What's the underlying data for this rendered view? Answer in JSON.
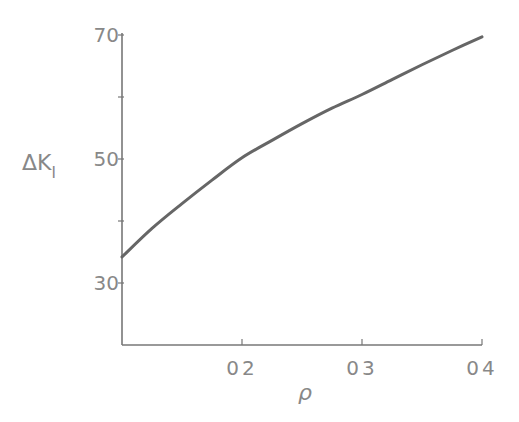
{
  "chart_data": {
    "type": "line",
    "title": "",
    "xlabel": "ρ",
    "ylabel_main": "ΔK",
    "ylabel_sub": "I",
    "xlim": [
      0.1,
      0.4
    ],
    "ylim": [
      20,
      70
    ],
    "x_ticks": [
      0.2,
      0.3,
      0.4
    ],
    "x_tick_labels": [
      "02",
      "03",
      "04"
    ],
    "y_ticks": [
      30,
      40,
      50,
      60,
      70
    ],
    "y_tick_labels": [
      {
        "value": 30,
        "label": "30"
      },
      {
        "value": 50,
        "label": "50"
      },
      {
        "value": 70,
        "label": "70"
      }
    ],
    "grid": false,
    "series": [
      {
        "name": "ΔK_I",
        "x": [
          0.1,
          0.125,
          0.15,
          0.175,
          0.2,
          0.225,
          0.25,
          0.275,
          0.3,
          0.325,
          0.35,
          0.375,
          0.4
        ],
        "y": [
          34.2,
          38.8,
          42.8,
          46.6,
          50.2,
          53.0,
          55.7,
          58.2,
          60.4,
          62.8,
          65.2,
          67.5,
          69.7
        ]
      }
    ]
  }
}
